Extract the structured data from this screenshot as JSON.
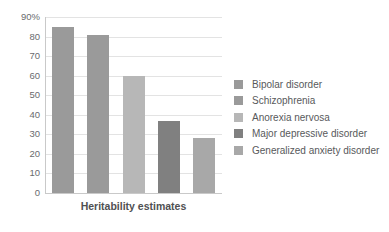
{
  "chart_data": {
    "type": "bar",
    "title": "",
    "subtitle": "",
    "xlabel": "Heritability estimates",
    "ylabel": "",
    "categories": [
      "Bipolar disorder",
      "Schizophrenia",
      "Anorexia nervosa",
      "Major depressive disorder",
      "Generalized anxiety disorder"
    ],
    "values": [
      85,
      81,
      60,
      37,
      28
    ],
    "ylim": [
      0,
      90
    ],
    "grid": true,
    "legend_position": "right",
    "y_ticks": [
      {
        "label": "90%",
        "value": 90
      },
      {
        "label": "80",
        "value": 80
      },
      {
        "label": "70",
        "value": 70
      },
      {
        "label": "60",
        "value": 60
      },
      {
        "label": "50",
        "value": 50
      },
      {
        "label": "40",
        "value": 40
      },
      {
        "label": "30",
        "value": 30
      },
      {
        "label": "20",
        "value": 20
      },
      {
        "label": "10",
        "value": 10
      },
      {
        "label": "0",
        "value": 0
      }
    ],
    "series_colors": [
      "#9a9a9a",
      "#9a9a9a",
      "#b7b7b7",
      "#808080",
      "#a8a8a8"
    ],
    "legend": [
      {
        "label": "Bipolar disorder",
        "color": "#9a9a9a"
      },
      {
        "label": "Schizophrenia",
        "color": "#9a9a9a"
      },
      {
        "label": "Anorexia nervosa",
        "color": "#b7b7b7"
      },
      {
        "label": "Major depressive disorder",
        "color": "#808080"
      },
      {
        "label": "Generalized anxiety disorder",
        "color": "#a8a8a8"
      }
    ],
    "colors": {
      "gridline": "#e3e3e3",
      "axis": "#c9c9c9",
      "tick_text": "#6a6b6d",
      "label_text": "#58595b",
      "background": "#ffffff"
    }
  }
}
